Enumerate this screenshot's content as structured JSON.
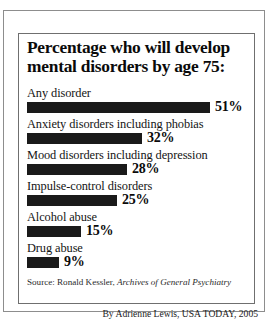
{
  "chart_data": {
    "type": "bar",
    "title": "Percentage who will develop mental disorders by age 75:",
    "orientation": "horizontal",
    "categories": [
      "Any disorder",
      "Anxiety disorders including phobias",
      "Mood disorders including depression",
      "Impulse-control disorders",
      "Alcohol abuse",
      "Drug abuse"
    ],
    "values": [
      51,
      32,
      28,
      25,
      15,
      9
    ],
    "value_labels": [
      "51%",
      "32%",
      "28%",
      "25%",
      "15%",
      "9%"
    ],
    "xlabel": "",
    "ylabel": "",
    "xlim": [
      0,
      51
    ],
    "grid": false,
    "legend": null,
    "bar_color": "#1a1a1a",
    "background": "#ffffff"
  },
  "header": {
    "title_line_1": "Percentage who will develop",
    "title_line_2": "mental disorders by age 75:"
  },
  "rows": [
    {
      "label": "Any disorder",
      "value": 51,
      "value_label": "51%"
    },
    {
      "label": "Anxiety disorders including phobias",
      "value": 32,
      "value_label": "32%"
    },
    {
      "label": "Mood disorders including depression",
      "value": 28,
      "value_label": "28%"
    },
    {
      "label": "Impulse-control disorders",
      "value": 25,
      "value_label": "25%"
    },
    {
      "label": "Alcohol abuse",
      "value": 15,
      "value_label": "15%"
    },
    {
      "label": "Drug abuse",
      "value": 9,
      "value_label": "9%"
    }
  ],
  "footer": {
    "source_prefix": "Source: Ronald Kessler,",
    "source_journal": "Archives of General Psychiatry",
    "byline": "By Adrienne Lewis, USA TODAY, 2005"
  }
}
